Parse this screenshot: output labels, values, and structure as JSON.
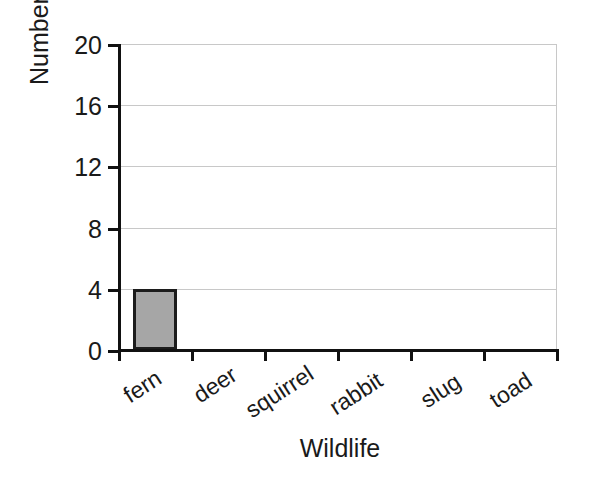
{
  "chart_data": {
    "type": "bar",
    "title": "",
    "xlabel": "Wildlife",
    "ylabel": "Number seen",
    "categories": [
      "fern",
      "deer",
      "squirrel",
      "rabbit",
      "slug",
      "toad"
    ],
    "values": [
      4,
      0,
      0,
      0,
      0,
      0
    ],
    "ylim": [
      0,
      20
    ],
    "yticks": [
      0,
      4,
      8,
      12,
      16,
      20
    ],
    "ytick_labels": [
      "0",
      "4",
      "8",
      "12",
      "16",
      "20"
    ],
    "grid": true,
    "grid_axis": "y",
    "legend": false,
    "legend_position": "none",
    "bar_fill_color": "#a6a6a6",
    "bar_edge_color": "#1c1c1c",
    "gridline_color": "#c8c8c8",
    "axis_color": "#111111",
    "text_color": "#1a1a1a",
    "background_color": "#ffffff",
    "xtick_label_rotation": -33
  }
}
